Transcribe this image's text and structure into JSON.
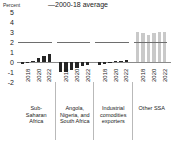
{
  "chart_data": {
    "type": "bar",
    "title": "",
    "ylabel": "Percent",
    "xlabel": "",
    "ylim": [
      -2,
      5
    ],
    "yticks": [
      "5",
      "4",
      "3",
      "2",
      "1",
      "0",
      "-1",
      "-2"
    ],
    "grid": false,
    "legend_position": "top-center",
    "legend": [
      {
        "label": "2000-18 average",
        "marker": "line",
        "color": "#6e6e6e"
      }
    ],
    "x": [
      "2018",
      "2019",
      "2020",
      "2021",
      "2022",
      "2023"
    ],
    "xtick_labels": [
      "2018",
      "2020",
      "2022"
    ],
    "groups": [
      {
        "name": "Sub-Saharan Africa",
        "caption_lines": [
          "Sub-",
          "Saharan",
          "Africa"
        ],
        "color": "#262626",
        "average_2000_18": 2.0,
        "values": [
          -0.15,
          -0.1,
          0.15,
          0.45,
          0.65,
          0.85
        ]
      },
      {
        "name": "Angola, Nigeria, and South Africa",
        "caption_lines": [
          "Angola,",
          "Nigeria, and",
          "South Africa"
        ],
        "color": "#262626",
        "average_2000_18": 2.0,
        "values": [
          -0.95,
          -0.95,
          -0.8,
          -0.55,
          -0.4,
          -0.25
        ]
      },
      {
        "name": "Industrial comodities exporters",
        "caption_lines": [
          "Industrial",
          "comodities",
          "exporters"
        ],
        "color": "#262626",
        "average_2000_18": 2.0,
        "values": [
          -0.25,
          -0.2,
          -0.1,
          0.1,
          0.15,
          0.2
        ]
      },
      {
        "name": "Other SSA",
        "caption_lines": [
          "Other SSA"
        ],
        "color": "#c9c9c9",
        "average_2000_18": 2.0,
        "values": [
          3.0,
          2.95,
          2.7,
          2.9,
          3.0,
          3.0
        ]
      }
    ]
  },
  "axis": {
    "y_title": "Percent"
  },
  "legend_text": "—2000-18 average"
}
